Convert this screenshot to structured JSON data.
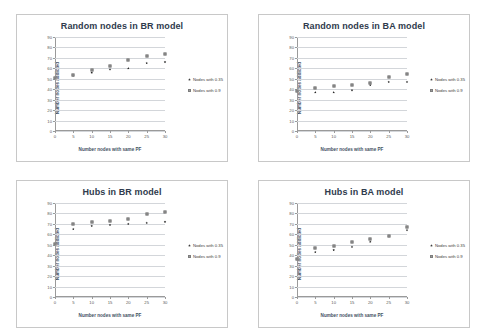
{
  "figure": {
    "panels": [
      {
        "id": "random-br",
        "chart_data": {
          "type": "scatter",
          "title": "Random nodes in BR model",
          "xlabel": "Number nodes with same PF",
          "ylabel": "Number nodes addicted",
          "xlim": [
            0,
            30
          ],
          "ylim": [
            0,
            90
          ],
          "xticks": [
            0,
            5,
            10,
            15,
            20,
            25,
            30
          ],
          "yticks": [
            0,
            10,
            20,
            30,
            40,
            50,
            60,
            70,
            80,
            90
          ],
          "grid": true,
          "legend_position": "right",
          "x": [
            0,
            5,
            10,
            15,
            20,
            25,
            30
          ],
          "series": [
            {
              "name": "Nodes with 0.35",
              "values": [
                51,
                53,
                56,
                59,
                60,
                65,
                66
              ]
            },
            {
              "name": "Nodes with 0.9",
              "values": [
                51,
                54,
                58,
                62,
                68,
                72,
                74
              ]
            }
          ]
        }
      },
      {
        "id": "random-ba",
        "chart_data": {
          "type": "scatter",
          "title": "Random nodes in BA model",
          "xlabel": "Number nodes with same PF",
          "ylabel": "Number nodes addicted",
          "xlim": [
            0,
            30
          ],
          "ylim": [
            0,
            90
          ],
          "xticks": [
            0,
            5,
            10,
            15,
            20,
            25,
            30
          ],
          "yticks": [
            0,
            10,
            20,
            30,
            40,
            50,
            60,
            70,
            80,
            90
          ],
          "grid": true,
          "legend_position": "right",
          "x": [
            0,
            5,
            10,
            15,
            20,
            25,
            30
          ],
          "series": [
            {
              "name": "Nodes with 0.35",
              "values": [
                38,
                37,
                37,
                39,
                44,
                47,
                47
              ]
            },
            {
              "name": "Nodes with 0.9",
              "values": [
                38,
                41,
                43,
                44,
                46,
                52,
                55
              ]
            }
          ]
        }
      },
      {
        "id": "hubs-br",
        "chart_data": {
          "type": "scatter",
          "title": "Hubs in BR model",
          "xlabel": "Number nodes with same PF",
          "ylabel": "Number nodes addicted",
          "xlim": [
            0,
            30
          ],
          "ylim": [
            0,
            90
          ],
          "xticks": [
            0,
            5,
            10,
            15,
            20,
            25,
            30
          ],
          "yticks": [
            0,
            10,
            20,
            30,
            40,
            50,
            60,
            70,
            80,
            90
          ],
          "grid": true,
          "legend_position": "right",
          "x": [
            0,
            5,
            10,
            15,
            20,
            25,
            30
          ],
          "series": [
            {
              "name": "Nodes with 0.35",
              "values": [
                51,
                65,
                68,
                69,
                70,
                71,
                72
              ]
            },
            {
              "name": "Nodes with 0.9",
              "values": [
                51,
                70,
                72,
                73,
                75,
                79,
                81
              ]
            }
          ]
        }
      },
      {
        "id": "hubs-ba",
        "chart_data": {
          "type": "scatter",
          "title": "Hubs in BA model",
          "xlabel": "Number nodes with same PF",
          "ylabel": "Number nodes addicted",
          "xlim": [
            0,
            30
          ],
          "ylim": [
            0,
            90
          ],
          "xticks": [
            0,
            5,
            10,
            15,
            20,
            25,
            30
          ],
          "yticks": [
            0,
            10,
            20,
            30,
            40,
            50,
            60,
            70,
            80,
            90
          ],
          "grid": true,
          "legend_position": "right",
          "x": [
            0,
            5,
            10,
            15,
            20,
            25,
            30
          ],
          "series": [
            {
              "name": "Nodes with 0.35",
              "values": [
                36,
                43,
                45,
                48,
                53,
                58,
                64
              ]
            },
            {
              "name": "Nodes with 0.9",
              "values": [
                36,
                47,
                49,
                53,
                56,
                58,
                67
              ]
            }
          ]
        }
      }
    ],
    "colors": {
      "series_0": "#2b2b2b",
      "series_1": "#9d9d9d",
      "grid": "#d3d6da",
      "axis": "#9a9a9a",
      "title": "#2f3b4d",
      "panel_border": "#c8c8c8",
      "background": "#ffffff"
    }
  }
}
